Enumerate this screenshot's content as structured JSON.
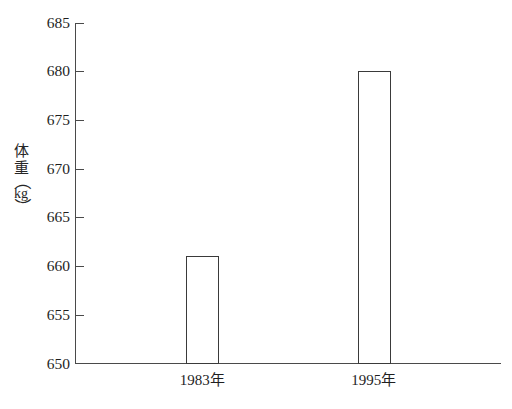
{
  "chart_data": {
    "type": "bar",
    "title": "",
    "subtitle": "",
    "xlabel": "",
    "ylabel": "体重（kg）",
    "ylabel_parts": {
      "char1": "体",
      "char2": "重",
      "paren_open": "（",
      "unit": "kg",
      "paren_close": "）"
    },
    "categories": [
      "1983年",
      "1995年"
    ],
    "values": [
      661,
      680
    ],
    "ylim": [
      650,
      685
    ],
    "yticks": [
      650,
      655,
      660,
      665,
      670,
      675,
      680,
      685
    ],
    "ytick_labels": [
      "650",
      "655",
      "660",
      "665",
      "670",
      "675",
      "680",
      "685"
    ],
    "grid": false,
    "legend": null,
    "bar_style": "outlined",
    "bar_fill": "#ffffff",
    "bar_stroke": "#3a3a3a",
    "axis_color": "#4a4a4a",
    "background": "#ffffff"
  },
  "axes": {
    "y_axis_name": "体重（kg）",
    "x_axis_name": ""
  },
  "bars": [
    {
      "label": "1983年",
      "value": 661,
      "value_text": "661"
    },
    {
      "label": "1995年",
      "value": 680,
      "value_text": "680"
    }
  ]
}
